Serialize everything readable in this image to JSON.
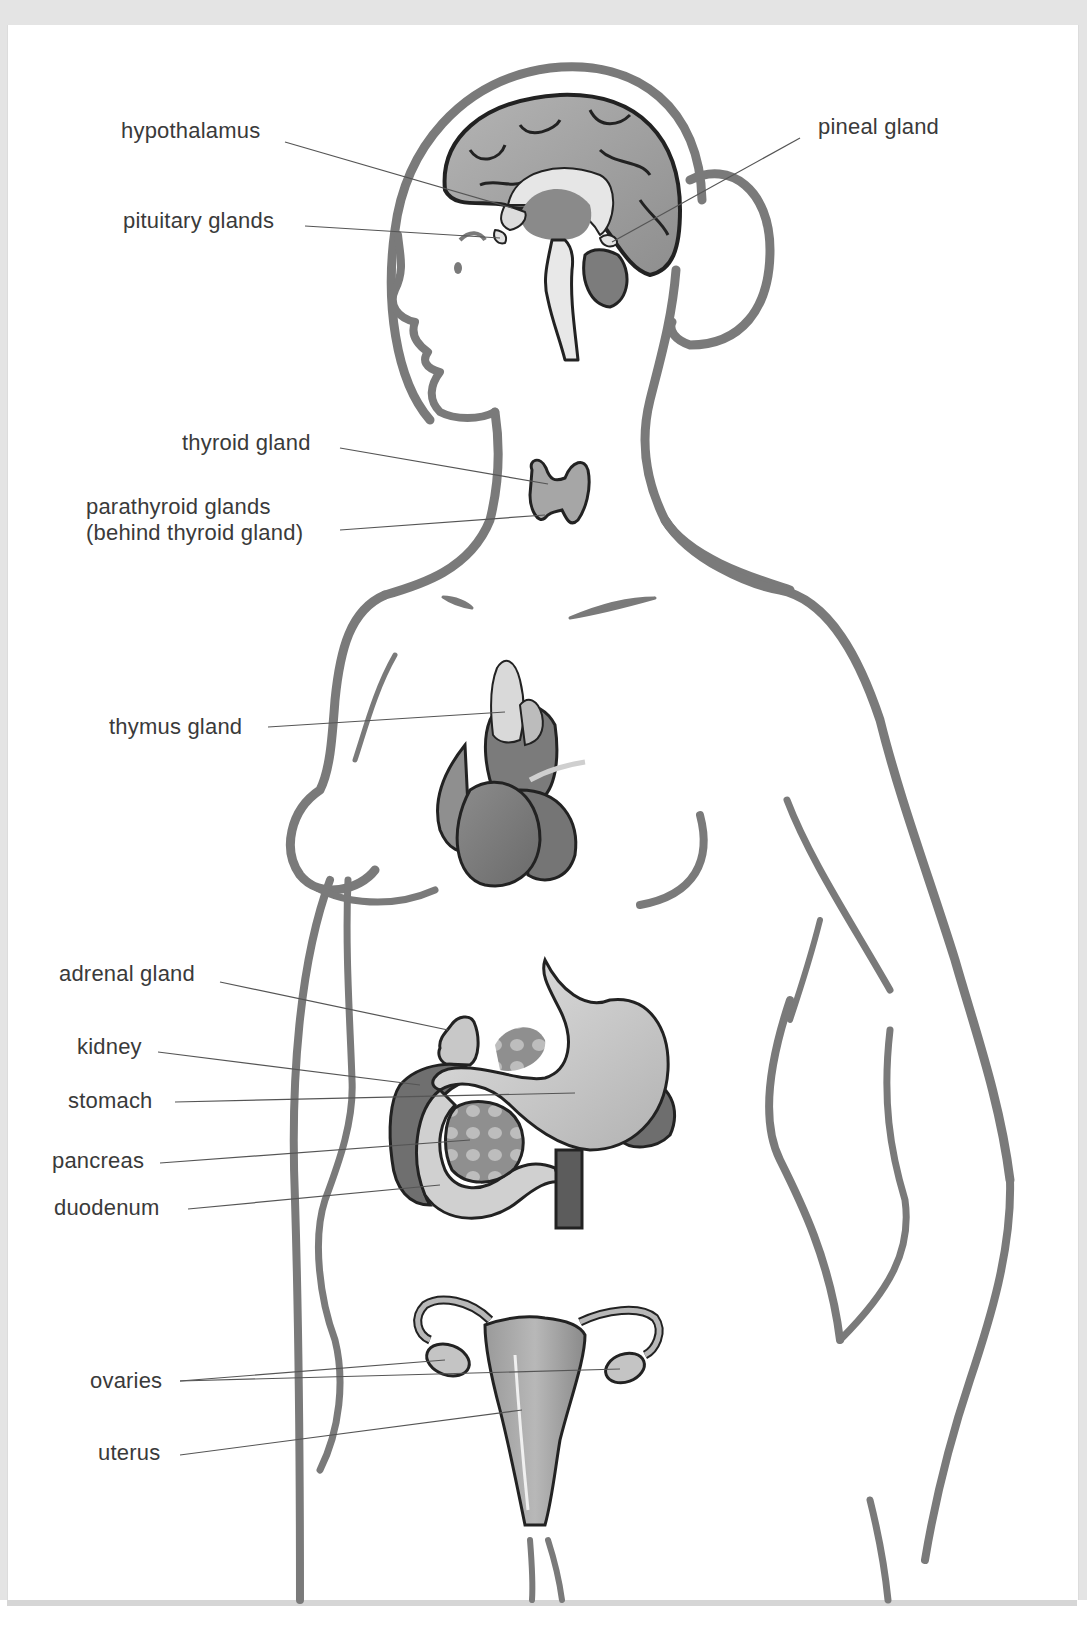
{
  "diagram": {
    "colors": {
      "page_background": "#e4e4e4",
      "panel_background": "#ffffff",
      "body_outline": "#7a7a7a",
      "organ_outline": "#2a2a2a",
      "organ_fill_dark": "#7d7d7d",
      "organ_fill_mid": "#a8a8a8",
      "organ_fill_light": "#d6d6d6",
      "label_text": "#3a3a3a",
      "leader_line": "#555555"
    },
    "labels": {
      "hypothalamus": "hypothalamus",
      "pituitary": "pituitary glands",
      "pineal": "pineal gland",
      "thyroid": "thyroid gland",
      "parathyroid_line1": "parathyroid glands",
      "parathyroid_line2": "(behind thyroid gland)",
      "thymus": "thymus gland",
      "adrenal": "adrenal gland",
      "kidney": "kidney",
      "stomach": "stomach",
      "pancreas": "pancreas",
      "duodenum": "duodenum",
      "ovaries": "ovaries",
      "uterus": "uterus"
    }
  }
}
